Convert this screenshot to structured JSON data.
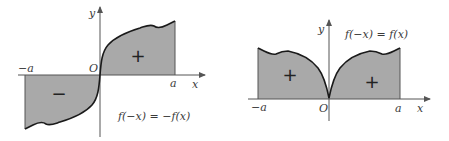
{
  "colors": {
    "fill": "#a9a9a9",
    "curve": "#1a1a1a",
    "axis": "#555555",
    "text": "#3a3a3a"
  },
  "diagrams": [
    {
      "name": "odd-function",
      "equation": "f(−x) = −f(x)",
      "axis_labels": {
        "x": "x",
        "y": "y",
        "origin": "O"
      },
      "tick_labels": {
        "left": "−a",
        "right": "a"
      },
      "region_signs": {
        "left": "−",
        "right": "+"
      }
    },
    {
      "name": "even-function",
      "equation": "f(−x) = f(x)",
      "axis_labels": {
        "x": "x",
        "y": "y",
        "origin": "O"
      },
      "tick_labels": {
        "left": "−a",
        "right": "a"
      },
      "region_signs": {
        "left": "+",
        "right": "+"
      }
    }
  ]
}
